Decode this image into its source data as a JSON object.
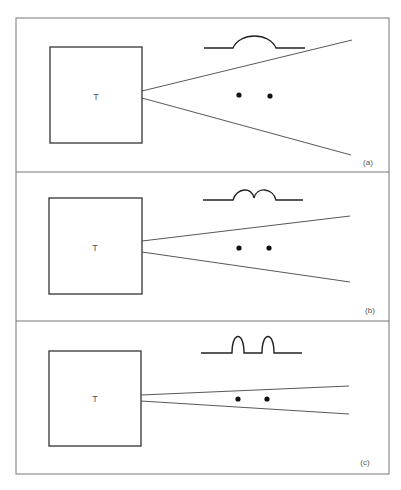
{
  "figure": {
    "stroke_color": "#333333",
    "border_color": "#777777",
    "panels": [
      {
        "id": "a",
        "label": "(a)",
        "transducer_label": "T",
        "beam": "wide",
        "pulse": "single broad hump"
      },
      {
        "id": "b",
        "label": "(b)",
        "transducer_label": "T",
        "beam": "medium",
        "pulse": "two overlapping humps"
      },
      {
        "id": "c",
        "label": "(c)",
        "transducer_label": "T",
        "beam": "narrow",
        "pulse": "two separated narrow pulses"
      }
    ]
  }
}
